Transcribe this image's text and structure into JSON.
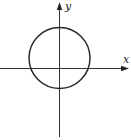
{
  "diagram": {
    "type": "coordinate-plane-with-circle",
    "axes": {
      "x_label": "x",
      "y_label": "y",
      "origin_px": [
        59.5,
        68.5
      ],
      "color": "#333333"
    },
    "circle": {
      "center_px": [
        59.5,
        58
      ],
      "radius_px": 30.5,
      "stroke": "#2a2a2a",
      "stroke_width": 1.5,
      "note": "circle centered on the y-axis, shifted above the origin; crosses the x-axis at two points and the y-axis at two points"
    }
  }
}
